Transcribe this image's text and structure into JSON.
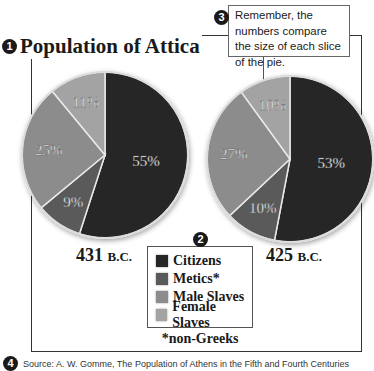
{
  "title": {
    "badge": "1",
    "text": "Population of Attica"
  },
  "callout": {
    "badge": "3",
    "text": "Remember, the numbers compare the size of each slice of the pie."
  },
  "legend": {
    "badge": "2",
    "items": [
      {
        "label": "Citizens",
        "color": "#262626"
      },
      {
        "label": "Metics*",
        "color": "#5a5a5a"
      },
      {
        "label": "Male Slaves",
        "color": "#8c8c8c"
      },
      {
        "label": "Female Slaves",
        "color": "#a3a3a3"
      }
    ]
  },
  "footnote": "*non-Greeks",
  "source": {
    "badge": "4",
    "text": "Source: A. W. Gomme, The Population of Athens in the Fifth and Fourth Centuries"
  },
  "chart_data": [
    {
      "type": "pie",
      "title": "431 B.C.",
      "year": "431",
      "era": "B.C.",
      "categories": [
        "Citizens",
        "Metics*",
        "Male Slaves",
        "Female Slaves"
      ],
      "values": [
        55,
        9,
        25,
        11
      ],
      "labels": [
        "55%",
        "9%",
        "25%",
        "11%"
      ],
      "colors": [
        "#262626",
        "#5a5a5a",
        "#8c8c8c",
        "#a3a3a3"
      ],
      "start_angle": "12 o'clock, clockwise"
    },
    {
      "type": "pie",
      "title": "425 B.C.",
      "year": "425",
      "era": "B.C.",
      "categories": [
        "Citizens",
        "Metics*",
        "Male Slaves",
        "Female Slaves"
      ],
      "values": [
        53,
        10,
        27,
        10
      ],
      "labels": [
        "53%",
        "10%",
        "27%",
        "10%"
      ],
      "colors": [
        "#262626",
        "#5a5a5a",
        "#8c8c8c",
        "#a3a3a3"
      ],
      "start_angle": "12 o'clock, clockwise"
    }
  ]
}
